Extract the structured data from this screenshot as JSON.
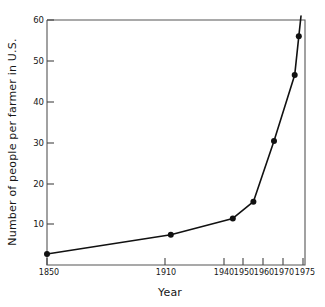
{
  "chart_data": {
    "type": "line",
    "title": "",
    "xlabel": "Year",
    "ylabel": "Number of people per farmer in U.S.",
    "x": [
      1850,
      1910,
      1940,
      1950,
      1960,
      1970,
      1972
    ],
    "values": [
      2.7,
      7.4,
      11.4,
      15.5,
      30.4,
      46.5,
      56.0
    ],
    "series": [
      {
        "name": "People per farmer",
        "x": [
          1850,
          1910,
          1940,
          1950,
          1960,
          1970,
          1972
        ],
        "values": [
          2.7,
          7.4,
          11.4,
          15.5,
          30.4,
          46.5,
          56.0
        ]
      }
    ],
    "xlim": [
      1850,
      1975
    ],
    "ylim": [
      0,
      60
    ],
    "xticks": [
      1850,
      1910,
      1940,
      1950,
      1960,
      1970,
      1975
    ],
    "xtick_labels": [
      "1850",
      "1910",
      "1940",
      "1950",
      "1960",
      "1970",
      "1975"
    ],
    "yticks": [
      10,
      20,
      30,
      40,
      50,
      60
    ],
    "ytick_labels": [
      "10",
      "20",
      "30",
      "40",
      "50",
      "60"
    ],
    "grid": false,
    "legend": "none",
    "marker": "filled-circle",
    "line_color": "#111111",
    "marker_color": "#111111",
    "axis_color": "#4a4a4a",
    "background": "#ffffff"
  }
}
